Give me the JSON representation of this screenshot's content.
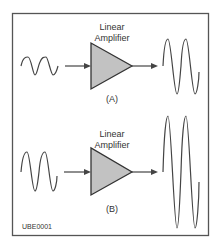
{
  "diagram": {
    "panels": [
      {
        "label_line1": "Linear",
        "label_line2": "Amplifier",
        "caption": "(A)",
        "input_wave": "small-amplitude sine, 2 cycles",
        "output_wave": "large-amplitude sine, 2 cycles"
      },
      {
        "label_line1": "Linear",
        "label_line2": "Amplifier",
        "caption": "(B)",
        "input_wave": "medium-amplitude sine, 2 cycles",
        "output_wave": "very large-amplitude sine, 2 cycles"
      }
    ],
    "figure_id": "UBE0001",
    "colors": {
      "frame": "#555555",
      "line": "#444444",
      "triangle_fill": "#c2c2c2"
    }
  }
}
